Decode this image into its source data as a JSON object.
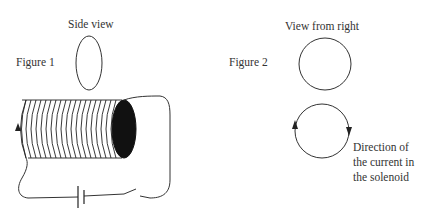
{
  "figure1": {
    "label": "Figure 1",
    "side_view_label": "Side view",
    "components": [
      "side-view-ellipse",
      "solenoid-coil",
      "solenoid-end-face",
      "circuit-wire",
      "battery",
      "open-switch",
      "current-arrow"
    ]
  },
  "figure2": {
    "label": "Figure 2",
    "view_label": "View from right",
    "caption_lines": [
      "Direction of",
      "the current in",
      "the solenoid"
    ],
    "current_direction": "clockwise"
  },
  "colors": {
    "line": "#333333",
    "fill_dark": "#111111",
    "background": "#ffffff"
  }
}
